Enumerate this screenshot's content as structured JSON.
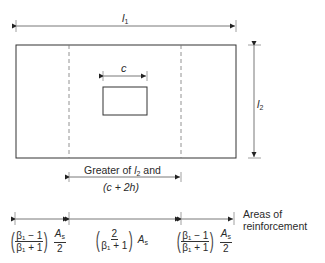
{
  "diagram": {
    "labels": {
      "l1": "l",
      "l1_sub": "1",
      "l2": "l",
      "l2_sub": "2",
      "c": "c",
      "greater_line1_pre": "Greater of ",
      "greater_l": "l",
      "greater_l_sub": "2",
      "greater_line1_post": " and",
      "greater_line2": "(c + 2h)",
      "areas_line1": "Areas of",
      "areas_line2": "reinforcement"
    },
    "strips": [
      {
        "name": "left-strip",
        "num": "β₁ − 1",
        "den": "β₁ + 1",
        "tail_num": "A",
        "tail_num_sub": "s",
        "tail_den": "2"
      },
      {
        "name": "middle-strip",
        "num": "2",
        "den": "β₁ + 1",
        "tail": "A",
        "tail_sub": "s"
      },
      {
        "name": "right-strip",
        "num": "β₁ − 1",
        "den": "β₁ + 1",
        "tail_num": "A",
        "tail_num_sub": "s",
        "tail_den": "2"
      }
    ],
    "colors": {
      "line": "#333333",
      "dashed": "#777777",
      "background": "#ffffff"
    }
  }
}
